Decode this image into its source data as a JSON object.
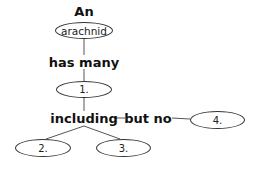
{
  "diagram": {
    "type": "concept-map",
    "title_word": "An",
    "root": {
      "label": "arachnid"
    },
    "links": {
      "root_to_1": "has many",
      "one_to_2_3": "including",
      "one_to_4": "but no"
    },
    "blanks": [
      {
        "id": "1",
        "label": "1."
      },
      {
        "id": "2",
        "label": "2."
      },
      {
        "id": "3",
        "label": "3."
      },
      {
        "id": "4",
        "label": "4."
      }
    ],
    "colors": {
      "line": "#555555",
      "text": "#111111",
      "background": "#ffffff"
    }
  }
}
